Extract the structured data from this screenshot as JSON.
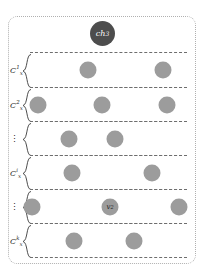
{
  "figure": {
    "top_caption": "",
    "outer_container_name": "channel-container",
    "border_color": "#b0b0b0",
    "row_border_color": "#6e6e6e",
    "node_color": "#9c9c9c",
    "channel_node_color": "#4d4d4d"
  },
  "channel_node": {
    "base": "ch",
    "subscript": "3",
    "label": "ch3"
  },
  "clusters": [
    {
      "label_base": "C",
      "label_sub": "x",
      "label_sup": "1",
      "label": "Cx1",
      "is_ellipsis": false,
      "nodes": [
        {
          "label": "",
          "x_pct": 37
        },
        {
          "label": "",
          "x_pct": 85
        }
      ]
    },
    {
      "label_base": "C",
      "label_sub": "x",
      "label_sup": "2",
      "label": "Cx2",
      "is_ellipsis": false,
      "nodes": [
        {
          "label": "",
          "x_pct": 5
        },
        {
          "label": "",
          "x_pct": 46
        },
        {
          "label": "",
          "x_pct": 87
        }
      ]
    },
    {
      "label_base": "",
      "label_sub": "",
      "label_sup": "",
      "label": "⋮",
      "is_ellipsis": true,
      "nodes": [
        {
          "label": "",
          "x_pct": 25
        },
        {
          "label": "",
          "x_pct": 54
        }
      ]
    },
    {
      "label_base": "C",
      "label_sub": "x",
      "label_sup": "i",
      "label": "Cxi",
      "is_ellipsis": false,
      "nodes": [
        {
          "label": "",
          "x_pct": 27
        },
        {
          "label": "",
          "x_pct": 78
        }
      ]
    },
    {
      "label_base": "",
      "label_sub": "",
      "label_sup": "",
      "label": "⋮",
      "is_ellipsis": true,
      "nodes": [
        {
          "label": "",
          "x_pct": 1
        },
        {
          "label": "v2",
          "label_base": "v",
          "label_sub": "2",
          "x_pct": 51
        },
        {
          "label": "",
          "x_pct": 95
        }
      ]
    },
    {
      "label_base": "C",
      "label_sub": "x",
      "label_sup": "k",
      "label": "Cxk",
      "is_ellipsis": false,
      "nodes": [
        {
          "label": "",
          "x_pct": 28
        },
        {
          "label": "",
          "x_pct": 66
        }
      ]
    }
  ]
}
